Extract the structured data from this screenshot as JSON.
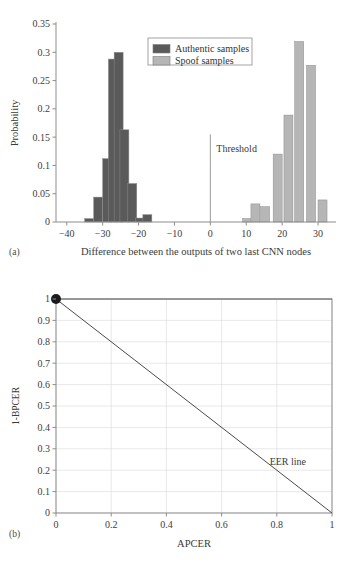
{
  "figure": {
    "panel_a_label": "(a)",
    "panel_b_label": "(b)"
  },
  "chart_data": [
    {
      "type": "bar",
      "id": "histogram",
      "title": "",
      "xlabel": "Difference between the outputs of two last CNN nodes",
      "ylabel": "Probability",
      "xlim": [
        -43,
        35
      ],
      "ylim": [
        0,
        0.35
      ],
      "grid": false,
      "xticks": [
        -40,
        -30,
        -20,
        -10,
        0,
        10,
        20,
        30
      ],
      "xtick_labels": [
        "−40",
        "−30",
        "−20",
        "−10",
        "0",
        "10",
        "20",
        "30"
      ],
      "yticks": [
        0,
        0.05,
        0.1,
        0.15,
        0.2,
        0.25,
        0.3,
        0.35
      ],
      "ytick_labels": [
        "0",
        "0.05",
        "0.1",
        "0.15",
        "0.2",
        "0.25",
        "0.3",
        "0.35"
      ],
      "bin_width": 2.5,
      "legend": {
        "position": "upper-center",
        "entries": [
          {
            "label": "Authentic samples",
            "color": "#5a5a5a"
          },
          {
            "label": "Spoof samples",
            "color": "#b6b6b6"
          }
        ]
      },
      "annotations": [
        {
          "text": "Threshold",
          "x": 0,
          "y": 0.125,
          "type": "vline-label"
        }
      ],
      "threshold_line": {
        "x": 0,
        "y_top": 0.155,
        "color": "#9a9a9a"
      },
      "series": [
        {
          "name": "Authentic samples",
          "color": "#5a5a5a",
          "bins": [
            -35.0,
            -32.5,
            -30.0,
            -27.5,
            -25.0,
            -22.5,
            -20.0
          ],
          "values": [
            0.006,
            0.044,
            0.112,
            0.288,
            0.3,
            0.163,
            0.068,
            0.007
          ]
        },
        {
          "name": "Spoof samples",
          "color": "#b6b6b6",
          "bins": [
            8.75,
            11.25,
            13.75,
            16.25,
            18.75,
            21.25,
            23.75,
            26.25
          ],
          "values": [
            0.006,
            0.032,
            0.027,
            0.12,
            0.189,
            0.319,
            0.277,
            0.039
          ]
        }
      ],
      "authentic_bars": [
        {
          "x": -35.0,
          "value": 0.006
        },
        {
          "x": -32.5,
          "value": 0.044
        },
        {
          "x": -30.0,
          "value": 0.112
        },
        {
          "x": -28.4,
          "value": 0.288
        },
        {
          "x": -26.8,
          "value": 0.3
        },
        {
          "x": -25.2,
          "value": 0.163
        },
        {
          "x": -23.0,
          "value": 0.068
        },
        {
          "x": -20.8,
          "value": 0.007
        },
        {
          "x": -18.8,
          "value": 0.013
        }
      ],
      "spoof_bars": [
        {
          "x": 9.0,
          "value": 0.006
        },
        {
          "x": 11.3,
          "value": 0.032
        },
        {
          "x": 14.0,
          "value": 0.027
        },
        {
          "x": 17.5,
          "value": 0.12
        },
        {
          "x": 20.5,
          "value": 0.189
        },
        {
          "x": 23.5,
          "value": 0.319
        },
        {
          "x": 26.8,
          "value": 0.277
        },
        {
          "x": 30.0,
          "value": 0.039
        }
      ]
    },
    {
      "type": "line",
      "id": "det-curve",
      "title": "",
      "xlabel": "APCER",
      "ylabel": "1-BPCER",
      "xlim": [
        0,
        1
      ],
      "ylim": [
        0,
        1
      ],
      "grid": true,
      "xticks": [
        0,
        0.2,
        0.4,
        0.6,
        0.8,
        1
      ],
      "xtick_labels": [
        "0",
        "0.2",
        "0.4",
        "0.6",
        "0.8",
        "1"
      ],
      "yticks": [
        0,
        0.1,
        0.2,
        0.3,
        0.4,
        0.5,
        0.6,
        0.7,
        0.8,
        0.9,
        1
      ],
      "ytick_labels": [
        "0",
        "0.1",
        "0.2",
        "0.3",
        "0.4",
        "0.5",
        "0.6",
        "0.7",
        "0.8",
        "0.9",
        "1"
      ],
      "annotations": [
        {
          "text": "EER line",
          "x": 0.84,
          "y": 0.225
        }
      ],
      "series": [
        {
          "name": "DET curve",
          "color": "#6f6f6f",
          "x": [
            0,
            1
          ],
          "y": [
            1,
            1
          ],
          "marker": {
            "x": 0,
            "y": 1,
            "color": "#1a1a1a",
            "size": 5
          }
        },
        {
          "name": "EER line",
          "color": "#4a4a4a",
          "x": [
            0,
            1
          ],
          "y": [
            1,
            0
          ]
        }
      ]
    }
  ],
  "colors": {
    "authentic": "#5a5a5a",
    "spoof": "#b6b6b6",
    "axis": "#8d8d8d",
    "grid": "#d8d8d8",
    "text": "#333333",
    "marker": "#1a1a1a"
  }
}
